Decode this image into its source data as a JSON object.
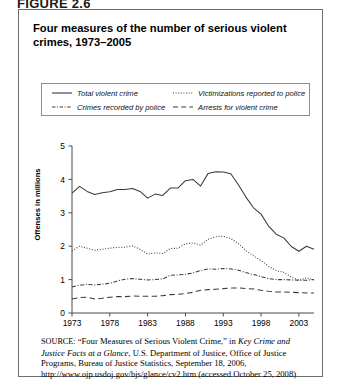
{
  "figure": {
    "label": "FIGURE 2.6",
    "title": "Four measures of the number of serious violent crimes, 1973–2005"
  },
  "legend": {
    "items": [
      {
        "key": "total",
        "label": "Total violent crime",
        "style": "solid",
        "color": "#3a3a3a"
      },
      {
        "key": "victimizations",
        "label": "Victimizations reported to police",
        "style": "dotted",
        "color": "#3a3a3a"
      },
      {
        "key": "recorded",
        "label": "Crimes recorded by police",
        "style": "dashdot",
        "color": "#3a3a3a"
      },
      {
        "key": "arrests",
        "label": "Arrests for violent crime",
        "style": "longdash",
        "color": "#3a3a3a"
      }
    ]
  },
  "source": {
    "prefix": "SOURCE:",
    "text_1": " “Four Measures of Serious Violent Crime,” in ",
    "italic_1": "Key Crime and Justice Facts at a Glance",
    "text_2": ", U.S. Department of Justice, Office of Justice Programs, Bureau of Justice Statistics, September 18, 2006, http://www.ojp.usdoj.gov/bjs/glance/cv2.htm (accessed October 25, 2008)"
  },
  "chart_data": {
    "type": "line",
    "title": "Four measures of the number of serious violent crimes, 1973–2005",
    "xlabel": "",
    "ylabel": "Offenses in millions",
    "xlim": [
      1973,
      2005
    ],
    "ylim": [
      0,
      5
    ],
    "yticks": [
      0,
      1,
      2,
      3,
      4,
      5
    ],
    "ytick_labels": [
      "0",
      "1",
      "2",
      "3",
      "4",
      "5"
    ],
    "xticks": [
      1973,
      1978,
      1983,
      1988,
      1993,
      1998,
      2003
    ],
    "xtick_labels": [
      "1973",
      "1978",
      "1983",
      "1988",
      "1993",
      "1998",
      "2003"
    ],
    "grid": false,
    "legend_position": "above-plot",
    "x": [
      1973,
      1974,
      1975,
      1976,
      1977,
      1978,
      1979,
      1980,
      1981,
      1982,
      1983,
      1984,
      1985,
      1986,
      1987,
      1988,
      1989,
      1990,
      1991,
      1992,
      1993,
      1994,
      1995,
      1996,
      1997,
      1998,
      1999,
      2000,
      2001,
      2002,
      2003,
      2004,
      2005
    ],
    "series": [
      {
        "name": "Total violent crime",
        "style": "solid",
        "values": [
          3.59,
          3.79,
          3.64,
          3.55,
          3.6,
          3.63,
          3.7,
          3.7,
          3.73,
          3.64,
          3.44,
          3.56,
          3.52,
          3.74,
          3.74,
          3.96,
          4.0,
          3.8,
          4.18,
          4.23,
          4.22,
          4.17,
          3.84,
          3.47,
          3.15,
          2.96,
          2.6,
          2.36,
          2.25,
          1.99,
          1.85,
          2.0,
          1.91
        ]
      },
      {
        "name": "Victimizations reported to police",
        "style": "dotted",
        "values": [
          1.86,
          2.0,
          1.94,
          1.88,
          1.91,
          1.94,
          1.97,
          1.97,
          2.01,
          1.91,
          1.76,
          1.8,
          1.78,
          1.93,
          1.94,
          2.07,
          2.1,
          2.03,
          2.21,
          2.28,
          2.3,
          2.23,
          2.08,
          1.87,
          1.71,
          1.57,
          1.4,
          1.27,
          1.22,
          1.07,
          0.98,
          1.05,
          0.99
        ]
      },
      {
        "name": "Crimes recorded by police",
        "style": "dashdot",
        "values": [
          0.78,
          0.83,
          0.86,
          0.84,
          0.86,
          0.89,
          0.96,
          1.01,
          1.03,
          1.01,
          0.99,
          1.0,
          1.02,
          1.13,
          1.14,
          1.16,
          1.2,
          1.27,
          1.32,
          1.31,
          1.33,
          1.32,
          1.28,
          1.21,
          1.15,
          1.09,
          1.03,
          1.0,
          1.0,
          0.99,
          0.98,
          0.98,
          1.0
        ]
      },
      {
        "name": "Arrests for violent crime",
        "style": "longdash",
        "values": [
          0.42,
          0.46,
          0.47,
          0.42,
          0.44,
          0.47,
          0.49,
          0.49,
          0.51,
          0.5,
          0.5,
          0.5,
          0.52,
          0.55,
          0.56,
          0.58,
          0.62,
          0.68,
          0.7,
          0.71,
          0.73,
          0.75,
          0.75,
          0.73,
          0.72,
          0.68,
          0.65,
          0.63,
          0.63,
          0.62,
          0.61,
          0.6,
          0.6
        ]
      }
    ]
  }
}
